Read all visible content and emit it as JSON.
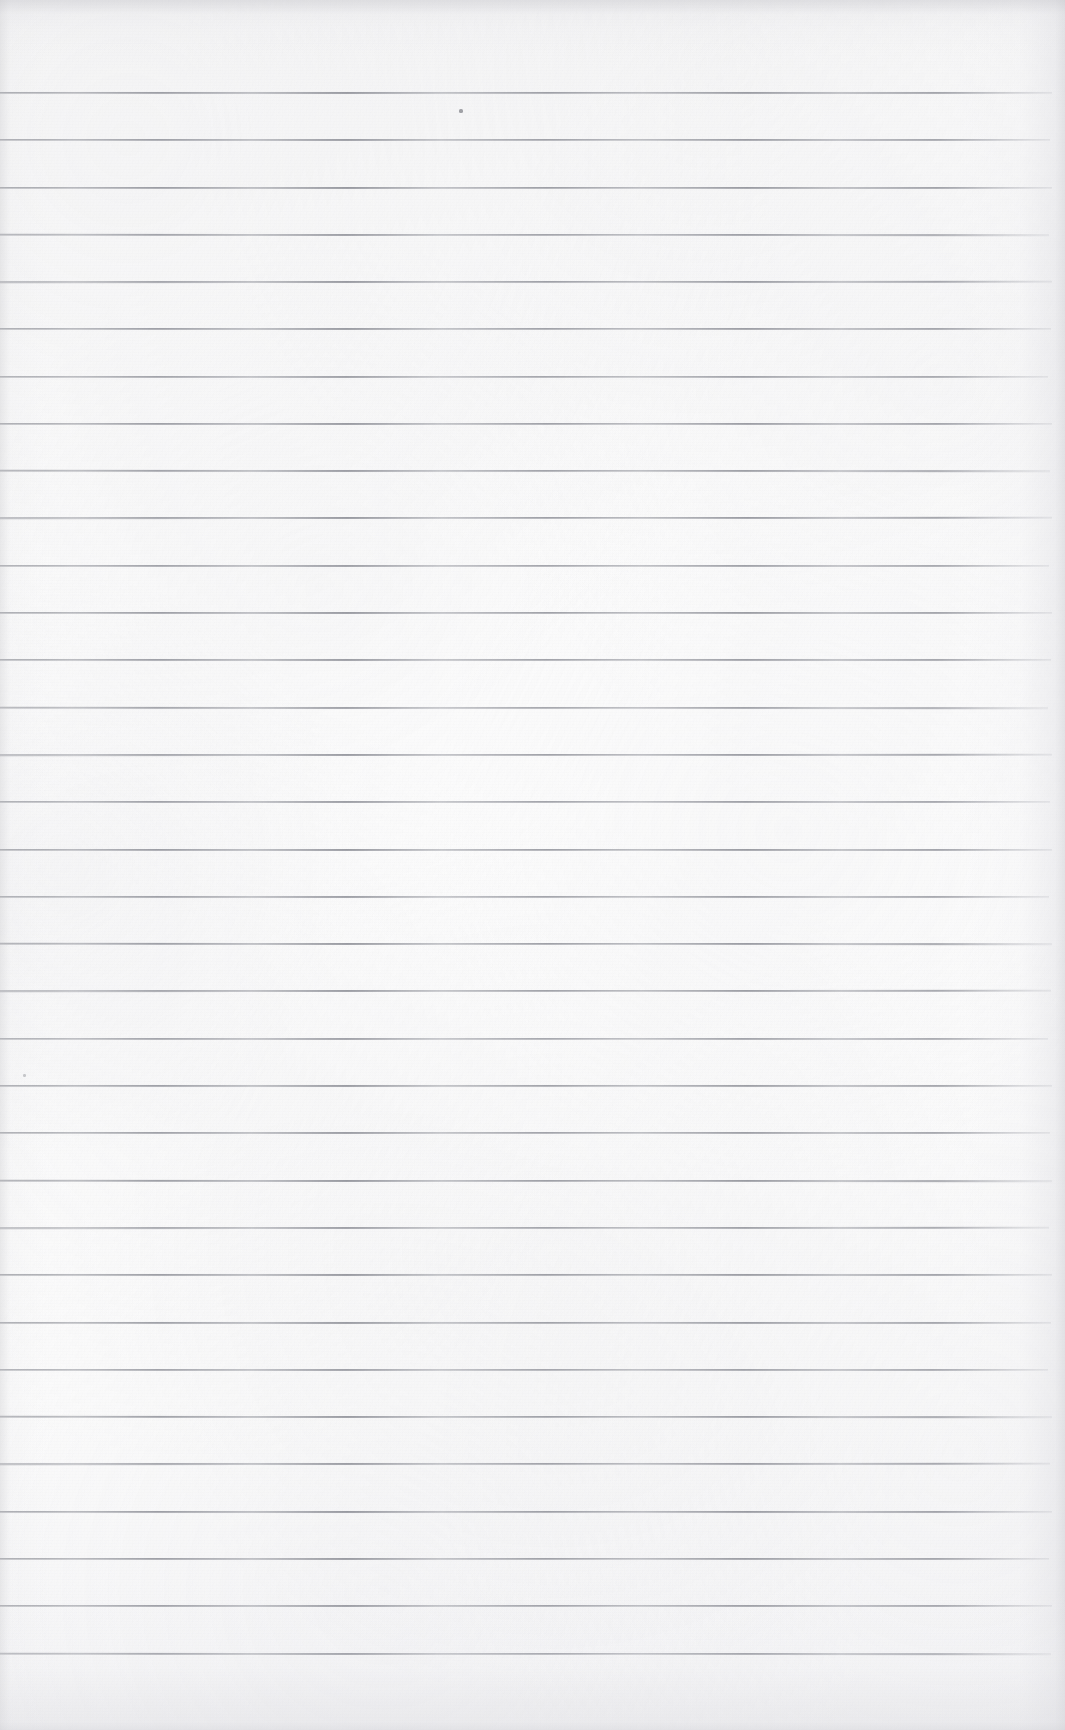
{
  "document": {
    "kind": "scanned-lined-notebook-page",
    "title": "Blank Ruled Notebook Page",
    "page_width": 1065,
    "page_height": 1730,
    "has_text": false,
    "has_handwriting": false,
    "text_content": "",
    "orientation": "portrait",
    "colors": {
      "paper": "#fbfbfb",
      "paper_shadow": "#f2f2f3",
      "rule_line": "#82848c",
      "rule_line_light": "#95979f",
      "speck": "#56585f"
    }
  },
  "ruling": {
    "style": "wide-ruled horizontal lines",
    "line_count": 34,
    "first_line_y": 92,
    "line_spacing": 47.3,
    "line_thickness": 2,
    "line_start_x": 0,
    "line_end_x": 1052,
    "margin_rule": "none",
    "holes": "none",
    "lines": [
      {
        "index": 1,
        "y": 92,
        "width": 1052,
        "opacity": 0.92
      },
      {
        "index": 2,
        "y": 139,
        "width": 1050,
        "opacity": 0.9
      },
      {
        "index": 3,
        "y": 187,
        "width": 1052,
        "opacity": 0.93
      },
      {
        "index": 4,
        "y": 234,
        "width": 1049,
        "opacity": 0.88
      },
      {
        "index": 5,
        "y": 281,
        "width": 1052,
        "opacity": 0.92
      },
      {
        "index": 6,
        "y": 328,
        "width": 1051,
        "opacity": 0.9
      },
      {
        "index": 7,
        "y": 376,
        "width": 1048,
        "opacity": 0.86
      },
      {
        "index": 8,
        "y": 423,
        "width": 1052,
        "opacity": 0.91
      },
      {
        "index": 9,
        "y": 470,
        "width": 1050,
        "opacity": 0.89
      },
      {
        "index": 10,
        "y": 517,
        "width": 1052,
        "opacity": 0.93
      },
      {
        "index": 11,
        "y": 565,
        "width": 1049,
        "opacity": 0.87
      },
      {
        "index": 12,
        "y": 612,
        "width": 1052,
        "opacity": 0.92
      },
      {
        "index": 13,
        "y": 659,
        "width": 1051,
        "opacity": 0.9
      },
      {
        "index": 14,
        "y": 707,
        "width": 1048,
        "opacity": 0.86
      },
      {
        "index": 15,
        "y": 754,
        "width": 1052,
        "opacity": 0.91
      },
      {
        "index": 16,
        "y": 801,
        "width": 1050,
        "opacity": 0.89
      },
      {
        "index": 17,
        "y": 849,
        "width": 1052,
        "opacity": 0.93
      },
      {
        "index": 18,
        "y": 896,
        "width": 1049,
        "opacity": 0.88
      },
      {
        "index": 19,
        "y": 943,
        "width": 1052,
        "opacity": 0.92
      },
      {
        "index": 20,
        "y": 990,
        "width": 1051,
        "opacity": 0.9
      },
      {
        "index": 21,
        "y": 1038,
        "width": 1048,
        "opacity": 0.85
      },
      {
        "index": 22,
        "y": 1085,
        "width": 1052,
        "opacity": 0.9
      },
      {
        "index": 23,
        "y": 1132,
        "width": 1050,
        "opacity": 0.89
      },
      {
        "index": 24,
        "y": 1180,
        "width": 1052,
        "opacity": 0.93
      },
      {
        "index": 25,
        "y": 1227,
        "width": 1049,
        "opacity": 0.87
      },
      {
        "index": 26,
        "y": 1274,
        "width": 1052,
        "opacity": 0.92
      },
      {
        "index": 27,
        "y": 1322,
        "width": 1051,
        "opacity": 0.9
      },
      {
        "index": 28,
        "y": 1369,
        "width": 1048,
        "opacity": 0.86
      },
      {
        "index": 29,
        "y": 1416,
        "width": 1052,
        "opacity": 0.91
      },
      {
        "index": 30,
        "y": 1463,
        "width": 1050,
        "opacity": 0.89
      },
      {
        "index": 31,
        "y": 1511,
        "width": 1052,
        "opacity": 0.93
      },
      {
        "index": 32,
        "y": 1558,
        "width": 1049,
        "opacity": 0.9
      },
      {
        "index": 33,
        "y": 1605,
        "width": 1052,
        "opacity": 0.92
      },
      {
        "index": 34,
        "y": 1653,
        "width": 1051,
        "opacity": 0.91
      }
    ]
  },
  "margins": {
    "top_blank_height": 92,
    "bottom_blank_height": 77,
    "right_blank_width": 13
  },
  "artifacts": {
    "specks": [
      {
        "name": "speck-upper-center",
        "x": 459,
        "y": 109,
        "w": 4,
        "h": 4,
        "opacity": 0.74
      },
      {
        "name": "speck-left-lower",
        "x": 23,
        "y": 1074,
        "w": 3,
        "h": 3,
        "opacity": 0.45
      }
    ],
    "vignette": "soft gray shading along left, right, top and bottom edges",
    "texture": "fine paper fibre grain with faint blotching"
  }
}
